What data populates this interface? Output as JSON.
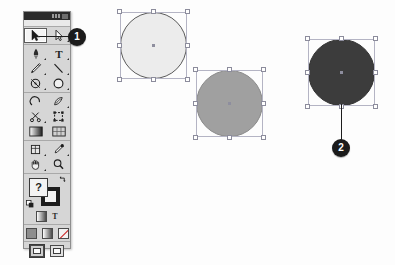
{
  "app": {
    "title": "Illustrator Tools panel",
    "panel_name": "Tools"
  },
  "toolbox": {
    "title_close_label": "x",
    "groups": [
      {
        "name": "selection-group",
        "rows": [
          [
            {
              "icon": "selection-arrow-icon",
              "label": "Selection Tool",
              "active": true,
              "has_flyout": false
            },
            {
              "icon": "direct-selection-arrow-icon",
              "label": "Direct Selection Tool",
              "active": false,
              "has_flyout": true
            }
          ]
        ]
      },
      {
        "name": "drawing-group",
        "rows": [
          [
            {
              "icon": "pen-icon",
              "label": "Pen Tool",
              "active": false,
              "has_flyout": true
            },
            {
              "icon": "type-icon",
              "label": "Type Tool",
              "active": false,
              "has_flyout": true
            }
          ],
          [
            {
              "icon": "pencil-icon",
              "label": "Pencil Tool",
              "active": false,
              "has_flyout": true
            },
            {
              "icon": "line-segment-icon",
              "label": "Line Segment Tool",
              "active": false,
              "has_flyout": true
            }
          ],
          [
            {
              "icon": "rotate-icon",
              "label": "Rotate Tool",
              "active": false,
              "has_flyout": true
            },
            {
              "icon": "ellipse-icon",
              "label": "Ellipse Tool",
              "active": false,
              "has_flyout": true
            }
          ]
        ]
      },
      {
        "name": "transform-group",
        "rows": [
          [
            {
              "icon": "reshape-arc-icon",
              "label": "Reshape Tool",
              "active": false,
              "has_flyout": false
            },
            {
              "icon": "warp-icon",
              "label": "Warp Tool",
              "active": false,
              "has_flyout": true
            }
          ],
          [
            {
              "icon": "scissors-icon",
              "label": "Scissors Tool",
              "active": false,
              "has_flyout": true
            },
            {
              "icon": "free-transform-icon",
              "label": "Free Transform Tool",
              "active": false,
              "has_flyout": false
            }
          ],
          [
            {
              "icon": "gradient-icon",
              "label": "Gradient Tool",
              "active": false,
              "has_flyout": false
            },
            {
              "icon": "mesh-icon",
              "label": "Mesh Tool",
              "active": false,
              "has_flyout": false
            }
          ]
        ]
      },
      {
        "name": "navigation-group",
        "rows": [
          [
            {
              "icon": "slice-icon",
              "label": "Slice Tool",
              "active": false,
              "has_flyout": true
            },
            {
              "icon": "eyedropper-icon",
              "label": "Eyedropper Tool",
              "active": false,
              "has_flyout": true
            }
          ],
          [
            {
              "icon": "hand-icon",
              "label": "Hand Tool",
              "active": false,
              "has_flyout": true
            },
            {
              "icon": "zoom-magnifier-icon",
              "label": "Zoom Tool",
              "active": false,
              "has_flyout": false
            }
          ]
        ]
      }
    ],
    "fill_stroke": {
      "fill_label": "?",
      "fill_name": "fill-swatch",
      "stroke_name": "stroke-swatch",
      "swap_name": "swap-fill-stroke-icon",
      "default_name": "default-fill-stroke-icon"
    },
    "mini_buttons": [
      {
        "name": "gradient-swatch-button",
        "kind": "grad"
      },
      {
        "name": "type-swatch-button",
        "kind": "text",
        "label": "T"
      }
    ],
    "paint_buttons": [
      {
        "name": "color-button",
        "kind": "solid"
      },
      {
        "name": "gradient-button",
        "kind": "grad"
      },
      {
        "name": "none-button",
        "kind": "none"
      }
    ],
    "screen_buttons": [
      {
        "name": "standard-screen-mode-button",
        "selected": true
      },
      {
        "name": "full-screen-mode-button",
        "selected": false,
        "has_flyout": true
      }
    ]
  },
  "artboard": {
    "shapes": [
      {
        "name": "circle-light",
        "label": "Light gray circle",
        "fill": "#ececec",
        "stroke": "#5a5a5a",
        "left": 120,
        "top": 12,
        "size": 67,
        "selected": true
      },
      {
        "name": "circle-medium",
        "label": "Medium gray circle",
        "fill": "#a0a0a0",
        "stroke": "#8a8a8a",
        "left": 196,
        "top": 70,
        "size": 67,
        "selected": true
      },
      {
        "name": "circle-dark",
        "label": "Dark gray circle",
        "fill": "#3c3c3c",
        "stroke": "#343434",
        "left": 308,
        "top": 39,
        "size": 67,
        "selected": true
      }
    ]
  },
  "callouts": [
    {
      "name": "callout-1",
      "number": "1",
      "target": "selection-tool",
      "left": 68,
      "top": 28,
      "leader": {
        "orientation": "horizontal",
        "left": 39,
        "top": 36,
        "length": 30,
        "thickness": 1
      }
    },
    {
      "name": "callout-2",
      "number": "2",
      "target": "circle-dark",
      "left": 332,
      "top": 139,
      "leader": {
        "orientation": "vertical",
        "left": 341,
        "top": 104,
        "length": 38,
        "thickness": 1
      }
    }
  ]
}
